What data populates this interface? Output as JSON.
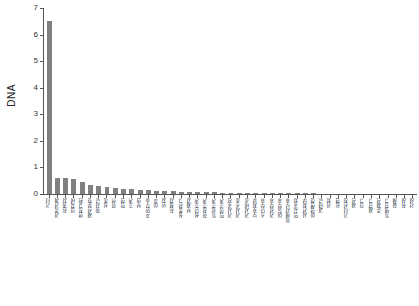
{
  "chart_data": {
    "type": "bar",
    "title": "",
    "subtitle": "",
    "xlabel": "",
    "ylabel": "DNA",
    "ylim": [
      0,
      7
    ],
    "yticks": [
      "0",
      "1",
      "2",
      "3",
      "4",
      "5",
      "6",
      "7"
    ],
    "grid": false,
    "legend": false,
    "legend_position": "none",
    "bar_color": "#808080",
    "axis_color": "#555555",
    "orientation": "vertical",
    "categories": [
      "기타",
      "가족관계",
      "친권자",
      "양육비",
      "면접교섭",
      "재산분할",
      "위자료",
      "상속",
      "유언",
      "입양",
      "후견",
      "부양",
      "혼인무효",
      "이혼",
      "인지",
      "친생자",
      "실종선고",
      "부재자",
      "성년후견",
      "한정후견",
      "특정후견",
      "임의후견",
      "가사조정",
      "가사소송",
      "가사비송",
      "보호처분",
      "소년보호",
      "가정보호",
      "아동보호",
      "피해자보호",
      "임시조치",
      "사전처분",
      "이행명령",
      "과태료",
      "감치",
      "집행",
      "기타신청",
      "재심",
      "항고",
      "재항고",
      "준재심",
      "특별항고",
      "화해",
      "취하",
      "각하"
    ],
    "values": [
      6.5,
      0.62,
      0.6,
      0.58,
      0.45,
      0.34,
      0.3,
      0.26,
      0.22,
      0.2,
      0.18,
      0.16,
      0.14,
      0.13,
      0.12,
      0.1,
      0.09,
      0.08,
      0.07,
      0.065,
      0.06,
      0.055,
      0.05,
      0.045,
      0.04,
      0.038,
      0.035,
      0.032,
      0.03,
      0.028,
      0.025,
      0.023,
      0.021,
      0.019,
      0.017,
      0.015,
      0.014,
      0.012,
      0.011,
      0.01,
      0.009,
      0.008,
      0.007,
      0.006,
      0.005
    ]
  }
}
